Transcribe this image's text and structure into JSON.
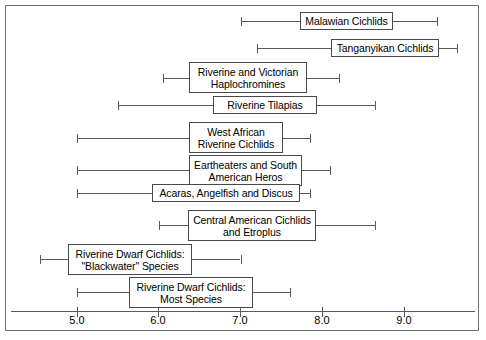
{
  "chart_data": {
    "type": "bar",
    "title": "",
    "subtitle": "",
    "xlabel": "",
    "ylabel": "",
    "xlim": [
      4.2,
      9.9
    ],
    "grid": false,
    "legend": "none",
    "orientation": "horizontal",
    "value_unit": "pH",
    "xticks": [
      "5.0",
      "6.0",
      "7.0",
      "8.0",
      "9.0"
    ],
    "xtick_values": [
      5.0,
      6.0,
      7.0,
      8.0,
      9.0
    ],
    "categories": [
      "Malawian Cichlids",
      "Tanganyikan Cichlids",
      "Riverine and Victorian Haplochromines",
      "Riverine Tilapias",
      "West African Riverine Cichlids",
      "Eartheaters and South American Heros",
      "Acaras, Angelfish and Discus",
      "Central American Cichlids and Etroplus",
      "Riverine Dwarf Cichlids: \"Blackwater\" Species",
      "Riverine Dwarf Cichlids: Most Species"
    ],
    "ranges": [
      {
        "label": "Malawian Cichlids",
        "low": 7.0,
        "high": 9.4
      },
      {
        "label": "Tanganyikan Cichlids",
        "low": 7.2,
        "high": 9.65
      },
      {
        "label": "Riverine and Victorian Haplochromines",
        "low": 6.05,
        "high": 8.2
      },
      {
        "label": "Riverine Tilapias",
        "low": 5.5,
        "high": 8.65
      },
      {
        "label": "West African Riverine Cichlids",
        "low": 5.0,
        "high": 7.85
      },
      {
        "label": "Eartheaters and South American Heros",
        "low": 5.0,
        "high": 8.1
      },
      {
        "label": "Acaras, Angelfish and Discus",
        "low": 5.0,
        "high": 7.85
      },
      {
        "label": "Central American Cichlids and Etroplus",
        "low": 6.0,
        "high": 8.65
      },
      {
        "label": "Riverine Dwarf Cichlids: \"Blackwater\" Species",
        "low": 4.55,
        "high": 7.0
      },
      {
        "label": "Riverine Dwarf Cichlids: Most Species",
        "low": 5.0,
        "high": 7.6
      }
    ]
  },
  "rows": [
    {
      "id": "malawian-cichlids",
      "lines": [
        "Malawian Cichlids"
      ],
      "low": 7.0,
      "high": 9.4,
      "y": 21,
      "box_left": 300,
      "box_right": 393,
      "box_top": 12,
      "box_height": 18
    },
    {
      "id": "tanganyikan-cichlids",
      "lines": [
        "Tanganyikan Cichlids"
      ],
      "low": 7.2,
      "high": 9.65,
      "y": 48,
      "box_left": 331,
      "box_right": 439,
      "box_top": 39,
      "box_height": 18
    },
    {
      "id": "riverine-victorian-haplochromines",
      "lines": [
        "Riverine and Victorian",
        "Haplochromines"
      ],
      "low": 6.05,
      "high": 8.2,
      "y": 78,
      "box_left": 189,
      "box_right": 307,
      "box_top": 62,
      "box_height": 31
    },
    {
      "id": "riverine-tilapias",
      "lines": [
        "Riverine Tilapias"
      ],
      "low": 5.5,
      "high": 8.65,
      "y": 105,
      "box_left": 213,
      "box_right": 317,
      "box_top": 96,
      "box_height": 18
    },
    {
      "id": "west-african-riverine-cichlids",
      "lines": [
        "West African",
        "Riverine Cichlids"
      ],
      "low": 5.0,
      "high": 7.85,
      "y": 138,
      "box_left": 189,
      "box_right": 283,
      "box_top": 122,
      "box_height": 31
    },
    {
      "id": "eartheaters-south-american-heros",
      "lines": [
        "Eartheaters and South",
        "American Heros"
      ],
      "low": 5.0,
      "high": 8.1,
      "y": 170,
      "box_left": 189,
      "box_right": 302,
      "box_top": 155,
      "box_height": 31
    },
    {
      "id": "acaras-angelfish-discus",
      "lines": [
        "Acaras, Angelfish and Discus"
      ],
      "low": 5.0,
      "high": 7.85,
      "y": 193,
      "box_left": 152,
      "box_right": 300,
      "box_top": 184,
      "box_height": 18
    },
    {
      "id": "central-american-cichlids-etroplus",
      "lines": [
        "Central American Cichlids",
        "and Etroplus"
      ],
      "low": 6.0,
      "high": 8.65,
      "y": 225,
      "box_left": 188,
      "box_right": 316,
      "box_top": 210,
      "box_height": 31
    },
    {
      "id": "riverine-dwarf-cichlids-blackwater",
      "lines": [
        "Riverine Dwarf Cichlids:",
        "\"Blackwater\" Species"
      ],
      "low": 4.55,
      "high": 7.0,
      "y": 259,
      "box_left": 68,
      "box_right": 192,
      "box_top": 244,
      "box_height": 31
    },
    {
      "id": "riverine-dwarf-cichlids-most-species",
      "lines": [
        "Riverine Dwarf Cichlids:",
        "Most Species"
      ],
      "low": 5.0,
      "high": 7.6,
      "y": 292,
      "box_left": 129,
      "box_right": 253,
      "box_top": 277,
      "box_height": 31
    }
  ],
  "axis": {
    "ticks": [
      {
        "label": "5.0",
        "value": 5.0,
        "x": 77
      },
      {
        "label": "6.0",
        "value": 6.0,
        "x": 158
      },
      {
        "label": "7.0",
        "value": 7.0,
        "x": 240
      },
      {
        "label": "8.0",
        "value": 8.0,
        "x": 322
      },
      {
        "label": "9.0",
        "value": 9.0,
        "x": 404
      }
    ]
  },
  "colors": {
    "background": "#ffffff",
    "line": "#5a5a5a",
    "box_border": "#4a4a4a",
    "frame": "#6f6f6f",
    "text": "#000000"
  }
}
